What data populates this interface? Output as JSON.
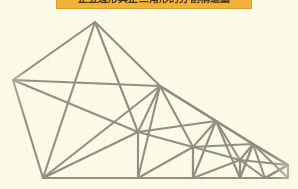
{
  "page": {
    "background_color": "#fbfbe8",
    "width": 298,
    "height": 189
  },
  "caption": {
    "text": "正五邊形與正三角形的分割構造圖",
    "banner_color": "#f2b33d",
    "border_color": "#d99a27",
    "text_color": "#3a2a10",
    "clipped": "top"
  },
  "figure": {
    "name": "recursive-triangulated-polygon-chain",
    "stroke_color": "#8a8a80",
    "stroke_width": 2.1,
    "vertices": {
      "apex": [
        95,
        22
      ],
      "left": [
        13,
        80
      ],
      "bottom_left": [
        43,
        178
      ],
      "baseline_right": [
        288,
        178
      ],
      "stage1_right": [
        160,
        86
      ],
      "stage1_base": [
        138,
        132
      ],
      "stage2_right": [
        216,
        121
      ],
      "stage2_base": [
        193,
        147
      ],
      "stage3_right": [
        253,
        144
      ],
      "stage3_base": [
        240,
        160
      ],
      "stage4_right": [
        288,
        164
      ]
    },
    "polylines": [
      {
        "name": "outer-hull",
        "points": "13,80 95,22 160,86 216,121 253,144 288,164 288,178 43,178 13,80"
      },
      {
        "name": "stage1-diagonals",
        "points": "95,22 43,178"
      },
      {
        "name": "stage1-diagonal-b",
        "points": "95,22 138,132"
      },
      {
        "name": "stage1-chord",
        "points": "13,80 138,132"
      },
      {
        "name": "stage1-chord-b",
        "points": "13,80 160,86"
      },
      {
        "name": "stage1-chord-c",
        "points": "43,178 160,86"
      },
      {
        "name": "stage2-chords",
        "points": "160,86 138,132 193,147 216,121 160,86"
      },
      {
        "name": "stage3-chords",
        "points": "216,121 193,147 240,160 253,144 216,121"
      },
      {
        "name": "stage4-chords",
        "points": "253,144 240,160 265,178 288,178 288,164 253,144"
      }
    ]
  }
}
